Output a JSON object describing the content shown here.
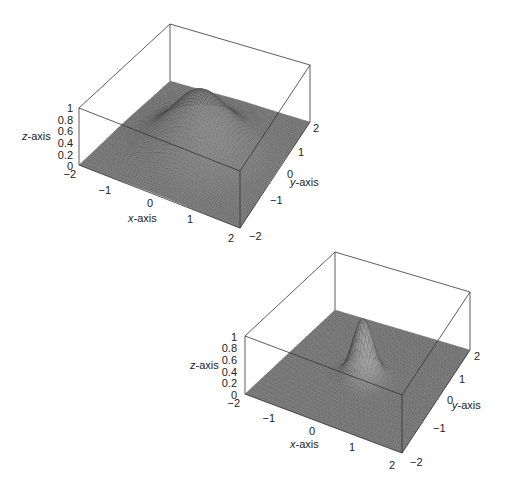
{
  "chart_data": [
    {
      "type": "surface3d",
      "title": "",
      "description": "Broad smooth bump centered at origin",
      "function": "z = exp(-(x^2 + y^2))",
      "xlabel": "x-axis",
      "ylabel": "y-axis",
      "zlabel": "z-axis",
      "xlim": [
        -2,
        2
      ],
      "ylim": [
        -2,
        2
      ],
      "zlim": [
        0,
        1
      ],
      "x_ticks": [
        "-2",
        "-1",
        "0",
        "1",
        "2"
      ],
      "y_ticks": [
        "-2",
        "-1",
        "0",
        "1",
        "2"
      ],
      "z_ticks": [
        "0",
        "0.2",
        "0.4",
        "0.6",
        "0.8",
        "1"
      ],
      "peak": {
        "x": 0,
        "y": 0,
        "z": 1
      },
      "k": 1.0,
      "grid": false,
      "projection": {
        "origin_floor": {
          "xm2_ym2": [
            79,
            165
          ],
          "xp2_ym2": [
            240,
            228
          ],
          "xp2_yp2": [
            310,
            122
          ],
          "xm2_yp2": [
            170,
            81
          ]
        },
        "z_height": 57
      },
      "label_pos": {
        "zlabel": [
          22,
          140
        ],
        "xlabel": [
          128,
          222
        ],
        "ylabel": [
          290,
          186
        ],
        "z_ticks": [
          [
            73,
            166
          ],
          [
            73,
            155
          ],
          [
            73,
            143
          ],
          [
            73,
            131
          ],
          [
            73,
            120
          ],
          [
            73,
            108
          ]
        ],
        "x_ticks": [
          [
            76,
            174
          ],
          [
            111,
            190
          ],
          [
            153,
            203
          ],
          [
            193,
            219
          ],
          [
            234,
            238
          ]
        ],
        "y_ticks": [
          [
            249,
            236
          ],
          [
            270,
            200
          ],
          [
            287,
            174
          ],
          [
            298,
            152
          ],
          [
            313,
            128
          ]
        ]
      }
    },
    {
      "type": "surface3d",
      "title": "",
      "description": "Narrow sharp peak centered at origin",
      "function": "z = exp(-8(x^2 + y^2))",
      "xlabel": "x-axis",
      "ylabel": "y-axis",
      "zlabel": "z-axis",
      "xlim": [
        -2,
        2
      ],
      "ylim": [
        -2,
        2
      ],
      "zlim": [
        0,
        1
      ],
      "x_ticks": [
        "-2",
        "-1",
        "0",
        "1",
        "2"
      ],
      "y_ticks": [
        "-2",
        "-1",
        "0",
        "1",
        "2"
      ],
      "z_ticks": [
        "0",
        "0.2",
        "0.4",
        "0.6",
        "0.8",
        "1"
      ],
      "peak": {
        "x": 0,
        "y": 0,
        "z": 1
      },
      "k": 8.0,
      "grid": false,
      "projection": {
        "origin_floor": {
          "xm2_ym2": [
            245,
            394
          ],
          "xp2_ym2": [
            402,
            453
          ],
          "xp2_yp2": [
            470,
            350
          ],
          "xm2_yp2": [
            335,
            310
          ]
        },
        "z_height": 58
      },
      "label_pos": {
        "zlabel": [
          190,
          369
        ],
        "xlabel": [
          290,
          448
        ],
        "ylabel": [
          452,
          409
        ],
        "z_ticks": [
          [
            237,
            395
          ],
          [
            237,
            383
          ],
          [
            237,
            372
          ],
          [
            237,
            360
          ],
          [
            237,
            348
          ],
          [
            237,
            337
          ]
        ],
        "x_ticks": [
          [
            240,
            403
          ],
          [
            275,
            418
          ],
          [
            315,
            431
          ],
          [
            355,
            447
          ],
          [
            395,
            465
          ]
        ],
        "y_ticks": [
          [
            410,
            462
          ],
          [
            433,
            428
          ],
          [
            447,
            400
          ],
          [
            459,
            379
          ],
          [
            474,
            356
          ]
        ]
      }
    }
  ]
}
